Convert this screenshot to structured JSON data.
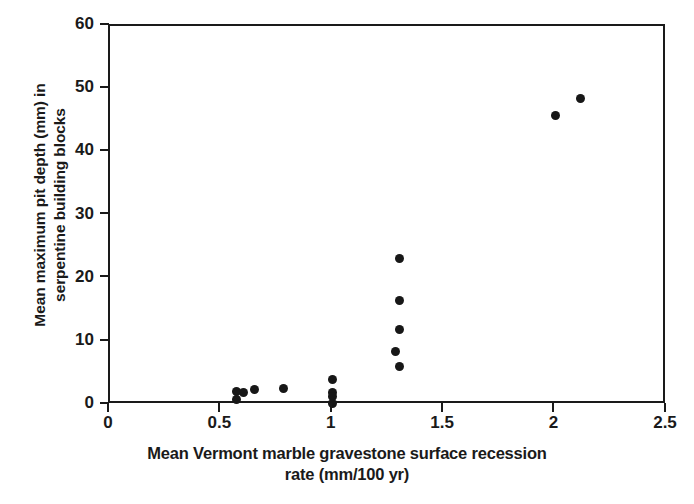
{
  "chart_data": {
    "type": "scatter",
    "title": "",
    "xlabel": "Mean Vermont marble gravestone surface recession\nrate (mm/100 yr)",
    "ylabel": "Mean maximum pit depth (mm) in\nserpentine building blocks",
    "xlim": [
      0,
      2.5
    ],
    "ylim": [
      0,
      60
    ],
    "xticks": [
      0,
      0.5,
      1,
      1.5,
      2,
      2.5
    ],
    "xticklabels": [
      "0",
      "0.5",
      "1",
      "1.5",
      "2",
      "2.5"
    ],
    "yticks": [
      0,
      10,
      20,
      30,
      40,
      50,
      60
    ],
    "yticklabels": [
      "0",
      "10",
      "20",
      "30",
      "40",
      "50",
      "60"
    ],
    "grid": false,
    "legend": false,
    "marker": "filled-circle",
    "marker_color": "#171717",
    "points": [
      {
        "x": 0.57,
        "y": 2.2
      },
      {
        "x": 0.57,
        "y": 0.8
      },
      {
        "x": 0.6,
        "y": 1.9
      },
      {
        "x": 0.65,
        "y": 2.4
      },
      {
        "x": 0.78,
        "y": 2.6
      },
      {
        "x": 1.0,
        "y": 4.0
      },
      {
        "x": 1.0,
        "y": 2.0
      },
      {
        "x": 1.0,
        "y": 1.3
      },
      {
        "x": 1.0,
        "y": 0.3
      },
      {
        "x": 1.3,
        "y": 23.2
      },
      {
        "x": 1.3,
        "y": 16.6
      },
      {
        "x": 1.3,
        "y": 11.9
      },
      {
        "x": 1.28,
        "y": 8.5
      },
      {
        "x": 1.3,
        "y": 6.1
      },
      {
        "x": 2.0,
        "y": 45.9
      },
      {
        "x": 2.11,
        "y": 48.6
      }
    ]
  },
  "axis": {
    "x_label": "Mean Vermont marble gravestone surface recession\nrate (mm/100 yr)",
    "y_label": "Mean maximum pit depth (mm) in\nserpentine building blocks"
  },
  "colors": {
    "axis": "#1a1a1a",
    "marker": "#171717",
    "background": "#ffffff"
  }
}
